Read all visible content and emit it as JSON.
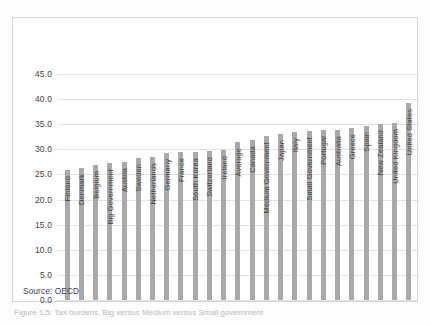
{
  "figure": {
    "source_note": "Source: OECD",
    "caption": "Figure 1.5: Tax burdens, Big versus Medium versus Small government",
    "bar_color": "#a9a9a9",
    "gridline_color": "#e2e2e2",
    "frame_color": "#d4d4d4"
  },
  "chart_data": {
    "type": "bar",
    "title": "",
    "xlabel": "",
    "ylabel": "",
    "ylim": [
      0.0,
      47.0
    ],
    "yticks": [
      "0.0",
      "5.0",
      "10.0",
      "15.0",
      "20.0",
      "25.0",
      "30.0",
      "35.0",
      "40.0",
      "45.0"
    ],
    "ytick_values": [
      0.0,
      5.0,
      10.0,
      15.0,
      20.0,
      25.0,
      30.0,
      35.0,
      40.0,
      45.0
    ],
    "grid": true,
    "legend": "none",
    "categories": [
      "Finland",
      "Denmark",
      "Belgium",
      "Big Government",
      "Austria",
      "Sweden",
      "Netherlands",
      "Germany",
      "France",
      "South Korea",
      "Switzerland",
      "Ireland",
      "Average",
      "Canada",
      "Medium Government",
      "Japan",
      "Italy",
      "Small Government",
      "Portugal",
      "Australia",
      "Greece",
      "Spain",
      "New Zealand",
      "United Kingdom",
      "United States"
    ],
    "values": [
      25.9,
      26.3,
      26.8,
      27.3,
      27.5,
      28.2,
      28.4,
      29.3,
      29.5,
      29.5,
      29.6,
      29.8,
      31.4,
      31.9,
      32.6,
      33.0,
      33.4,
      33.7,
      33.8,
      33.8,
      34.2,
      34.7,
      35.1,
      35.2,
      39.2
    ]
  }
}
